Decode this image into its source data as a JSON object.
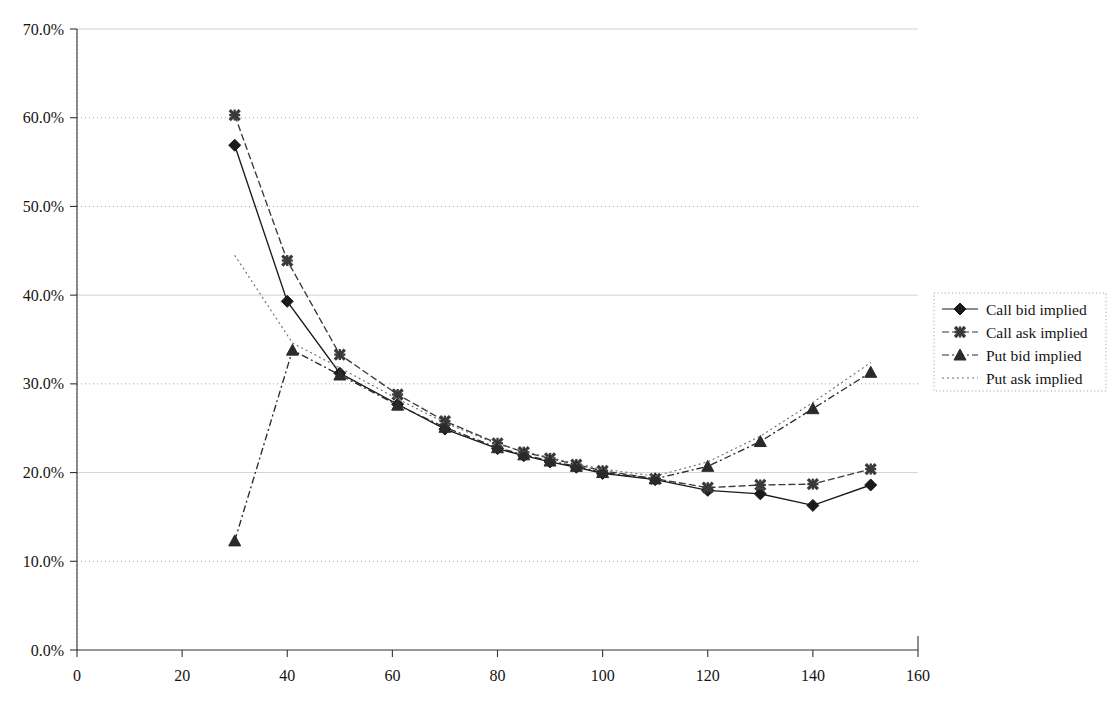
{
  "chart_data": {
    "type": "line",
    "title": "",
    "xlabel": "",
    "ylabel": "",
    "xlim": [
      0,
      160
    ],
    "ylim": [
      0,
      0.7
    ],
    "grid": true,
    "y_tick_labels": [
      "0.0%",
      "10.0%",
      "20.0%",
      "30.0%",
      "40.0%",
      "50.0%",
      "60.0%",
      "70.0%"
    ],
    "y_tick_values": [
      0,
      10,
      20,
      30,
      40,
      50,
      60,
      70
    ],
    "x_tick_labels": [
      "0",
      "20",
      "40",
      "60",
      "80",
      "100",
      "120",
      "140",
      "160"
    ],
    "x_tick_values": [
      0,
      20,
      40,
      60,
      80,
      100,
      120,
      140,
      160
    ],
    "legend_position": "right",
    "series": [
      {
        "name": "Call bid implied",
        "marker": "diamond",
        "line_style": "solid",
        "color": "#1a1a1a",
        "points": [
          [
            30,
            56.9
          ],
          [
            40,
            39.3
          ],
          [
            50,
            31.2
          ],
          [
            61,
            27.7
          ],
          [
            70,
            24.9
          ],
          [
            80,
            22.7
          ],
          [
            85,
            21.9
          ],
          [
            90,
            21.2
          ],
          [
            95,
            20.6
          ],
          [
            100,
            19.9
          ],
          [
            110,
            19.2
          ],
          [
            120,
            18.0
          ],
          [
            130,
            17.6
          ],
          [
            140,
            16.3
          ],
          [
            151,
            18.6
          ]
        ]
      },
      {
        "name": "Call ask implied",
        "marker": "cross",
        "line_style": "dashed",
        "color": "#3a3a3a",
        "points": [
          [
            30,
            60.3
          ],
          [
            40,
            43.9
          ],
          [
            50,
            33.3
          ],
          [
            61,
            28.8
          ],
          [
            70,
            25.8
          ],
          [
            80,
            23.3
          ],
          [
            85,
            22.3
          ],
          [
            90,
            21.6
          ],
          [
            95,
            20.9
          ],
          [
            100,
            20.2
          ],
          [
            110,
            19.3
          ],
          [
            120,
            18.3
          ],
          [
            130,
            18.6
          ],
          [
            140,
            18.7
          ],
          [
            151,
            20.4
          ]
        ]
      },
      {
        "name": "Put bid implied",
        "marker": "triangle",
        "line_style": "dashdot",
        "color": "#2a2a2a",
        "points": [
          [
            30,
            12.3
          ],
          [
            41,
            33.8
          ],
          [
            50,
            31.0
          ],
          [
            61,
            27.6
          ],
          [
            70,
            25.1
          ],
          [
            80,
            22.8
          ],
          [
            85,
            22.0
          ],
          [
            90,
            21.3
          ],
          [
            95,
            20.7
          ],
          [
            100,
            20.0
          ],
          [
            110,
            19.3
          ],
          [
            120,
            20.7
          ],
          [
            130,
            23.5
          ],
          [
            140,
            27.2
          ],
          [
            151,
            31.3
          ]
        ]
      },
      {
        "name": "Put ask implied",
        "marker": "none",
        "line_style": "dotted",
        "color": "#6a6a6a",
        "points": [
          [
            30,
            44.5
          ],
          [
            41,
            34.6
          ],
          [
            50,
            31.8
          ],
          [
            61,
            28.3
          ],
          [
            70,
            25.6
          ],
          [
            80,
            23.2
          ],
          [
            85,
            22.4
          ],
          [
            90,
            21.7
          ],
          [
            95,
            21.0
          ],
          [
            100,
            20.4
          ],
          [
            110,
            19.6
          ],
          [
            120,
            21.2
          ],
          [
            130,
            24.1
          ],
          [
            140,
            27.9
          ],
          [
            151,
            32.4
          ]
        ]
      }
    ]
  },
  "legend": {
    "items": [
      {
        "label": "Call bid implied"
      },
      {
        "label": "Call ask implied"
      },
      {
        "label": "Put bid implied"
      },
      {
        "label": "Put ask implied"
      }
    ]
  },
  "colors": {
    "axis": "#333333",
    "grid": "#9a9a9a",
    "background": "#ffffff"
  }
}
